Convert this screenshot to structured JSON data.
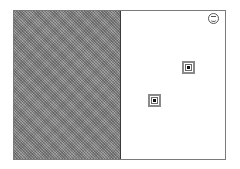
{
  "scene": {
    "left_panel": {
      "pattern": "gray-dither",
      "color": "#8a8a8a"
    },
    "right_panel": {
      "color": "#ffffff"
    },
    "smiley": {
      "icon": "smiley-icon",
      "x": 208,
      "y": 13
    },
    "targets": [
      {
        "id": "target-1",
        "x": 182,
        "y": 61
      },
      {
        "id": "target-2",
        "x": 148,
        "y": 94
      }
    ]
  }
}
